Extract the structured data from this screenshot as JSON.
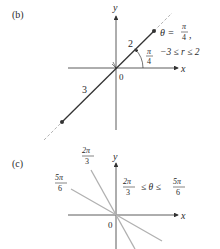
{
  "panels": [
    {
      "id": "b",
      "label": "(b)",
      "axes": {
        "x_label": "x",
        "y_label": "y",
        "origin_label": "0"
      },
      "segment": {
        "r_positive_length_label": "2",
        "r_negative_length_label": "3",
        "angle_label_num": "π",
        "angle_label_den": "4"
      },
      "condition": {
        "theta_prefix": "θ =",
        "theta_num": "π",
        "theta_den": "4",
        "theta_suffix": ",",
        "r_range": "−3 ≤ r ≤ 2"
      },
      "colors": {
        "line": "#333333",
        "dashed": "#aaaaaa",
        "axis": "#333333"
      }
    },
    {
      "id": "c",
      "label": "(c)",
      "axes": {
        "x_label": "x",
        "y_label": "y",
        "origin_label": "0"
      },
      "rays": [
        {
          "num": "2π",
          "den": "3"
        },
        {
          "num": "5π",
          "den": "6"
        }
      ],
      "condition": {
        "left_num": "2π",
        "left_den": "3",
        "middle": "≤ θ ≤",
        "right_num": "5π",
        "right_den": "6"
      },
      "colors": {
        "ray": "#b0b0b0",
        "axis": "#333333"
      }
    }
  ]
}
